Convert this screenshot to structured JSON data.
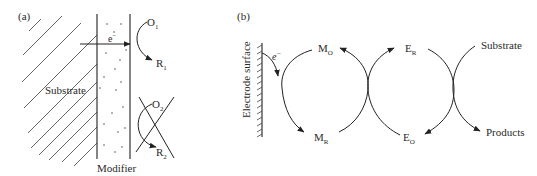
{
  "panel_a": {
    "label": "(a)",
    "substrate_label": "Substrate",
    "modifier_label": "Modifier",
    "electron": "e",
    "electron_sup": "−",
    "o1": "O",
    "o1_sub": "1",
    "r1": "R",
    "r1_sub": "1",
    "o2": "O",
    "o2_sub": "2",
    "r2": "R",
    "r2_sub": "2"
  },
  "panel_b": {
    "label": "(b)",
    "electrode_label": "Electrode surface",
    "electron": "e",
    "electron_sup": "−",
    "mo": "M",
    "mo_sub": "O",
    "mr": "M",
    "mr_sub": "R",
    "er": "E",
    "er_sub": "R",
    "eo": "E",
    "eo_sub": "O",
    "substrate": "Substrate",
    "products": "Products"
  },
  "colors": {
    "line": "#333333",
    "background": "#ffffff"
  }
}
